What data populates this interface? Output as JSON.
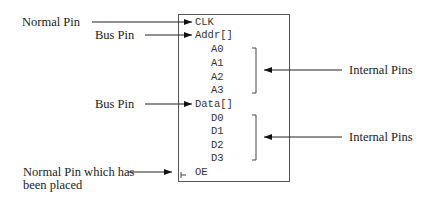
{
  "callouts": {
    "normal_pin": "Normal Pin",
    "bus_pin_1": "Bus Pin",
    "bus_pin_2": "Bus Pin",
    "internal_pins_1": "Internal Pins",
    "internal_pins_2": "Internal Pins",
    "placed_pin_line1": "Normal Pin which has",
    "placed_pin_line2": "been placed"
  },
  "symbol": {
    "pins": {
      "clk": "CLK",
      "addr": "Addr[]",
      "a0": "A0",
      "a1": "A1",
      "a2": "A2",
      "a3": "A3",
      "data": "Data[]",
      "d0": "D0",
      "d1": "D1",
      "d2": "D2",
      "d3": "D3",
      "oe": "OE"
    }
  }
}
